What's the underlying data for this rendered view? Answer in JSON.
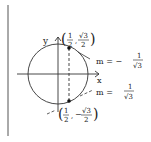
{
  "diagram": {
    "type": "unit-circle-tangents",
    "axes": {
      "x_label": "x",
      "y_label": "y"
    },
    "points": [
      {
        "label_x_num": "1",
        "label_x_den": "2",
        "sign": "",
        "label_y_num": "√3",
        "label_y_den": "2"
      },
      {
        "label_x_num": "1",
        "label_x_den": "2",
        "sign": "−",
        "label_y_num": "√3",
        "label_y_den": "2"
      }
    ],
    "tangents": [
      {
        "m_label": "m = −",
        "num": "1",
        "den": "√3"
      },
      {
        "m_label": "m =",
        "num": "1",
        "den": "√3"
      }
    ],
    "colors": {
      "ink": "#222222",
      "margin_line": "#555555"
    }
  }
}
